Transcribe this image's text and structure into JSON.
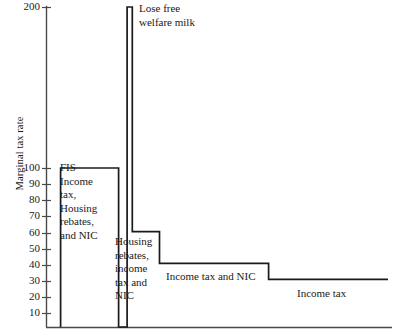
{
  "chart_data": {
    "type": "line",
    "title": "",
    "subtitle": "",
    "xlabel": "",
    "ylabel": "Marginal tax rate",
    "grid": false,
    "legend": "none",
    "ylim": [
      0,
      200
    ],
    "ytick_labels": [
      "200",
      "100",
      "90",
      "80",
      "70",
      "60",
      "50",
      "40",
      "30",
      "20",
      "10"
    ],
    "ytick_values": [
      200,
      100,
      90,
      80,
      70,
      60,
      50,
      40,
      30,
      20,
      10
    ],
    "xtick_labels": [],
    "series": [
      {
        "name": "Marginal tax rate step function",
        "steps": [
          {
            "label": "FIS, Income tax, Housing rebates, and NIC",
            "value": 100,
            "x_start": 0.04,
            "x_end": 0.21
          },
          {
            "label": "Lose free welfare milk",
            "value": 200,
            "x_start": 0.235,
            "x_end": 0.25
          },
          {
            "label": "Housing rebates, income tax and NIC",
            "value": 60,
            "x_start": 0.25,
            "x_end": 0.33
          },
          {
            "label": "Income tax and NIC",
            "value": 40,
            "x_start": 0.33,
            "x_end": 0.65
          },
          {
            "label": "Income tax",
            "value": 30,
            "x_start": 0.65,
            "x_end": 1.0
          }
        ]
      }
    ],
    "annotations": [
      {
        "name": "fis-block",
        "text": "FIS\nIncome\ntax,\nHousing\nrebates,\nand NIC"
      },
      {
        "name": "milk-spike",
        "text": "Lose free\nwelfare milk"
      },
      {
        "name": "housing-block",
        "text": "Housing\nrebates,\nincome\ntax and\nNIC"
      },
      {
        "name": "income-tax-nic",
        "text": "Income tax and NIC"
      },
      {
        "name": "income-tax",
        "text": "Income tax"
      }
    ],
    "colors": {
      "line": "#1a1a1a",
      "axis": "#4a4a4a",
      "background": "#ffffff",
      "text": "#1a1a1a"
    }
  },
  "axis": {
    "y_title": "Marginal tax rate",
    "ticks": [
      {
        "label": "200",
        "y": 7
      },
      {
        "label": "100",
        "y": 168
      },
      {
        "label": "90",
        "y": 184
      },
      {
        "label": "80",
        "y": 200
      },
      {
        "label": "70",
        "y": 216
      },
      {
        "label": "60",
        "y": 233
      },
      {
        "label": "50",
        "y": 249
      },
      {
        "label": "40",
        "y": 265
      },
      {
        "label": "30",
        "y": 281
      },
      {
        "label": "20",
        "y": 297
      },
      {
        "label": "10",
        "y": 313
      }
    ]
  },
  "annotations": {
    "fis": "FIS\nIncome\ntax,\nHousing\nrebates,\nand NIC",
    "welfare_milk": "Lose free\nwelfare milk",
    "housing": "Housing\nrebates,\nincome\ntax and\nNIC",
    "income_tax_nic": "Income tax and NIC",
    "income_tax": "Income tax"
  }
}
